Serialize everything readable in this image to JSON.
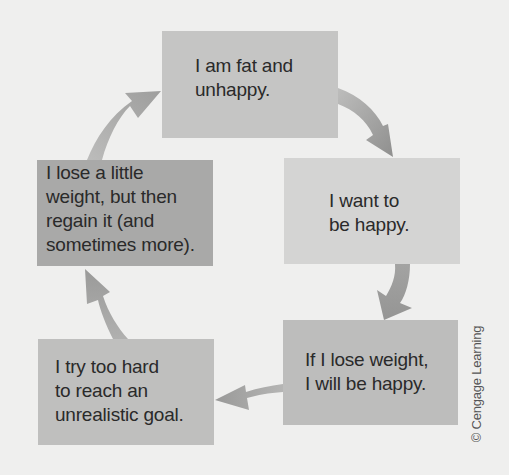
{
  "diagram": {
    "type": "cycle",
    "nodes": [
      {
        "id": "top",
        "text": "I am fat and\nunhappy.",
        "color": "#c5c5c4"
      },
      {
        "id": "right",
        "text": "I want to\nbe happy.",
        "color": "#d4d4d3"
      },
      {
        "id": "bottomright",
        "text": "If I lose weight,\nI will be happy.",
        "color": "#bdbdbc"
      },
      {
        "id": "bottomleft",
        "text": "I try too hard\nto reach an\nunrealistic goal.",
        "color": "#bfbfbe"
      },
      {
        "id": "left",
        "text": "I lose a little\nweight, but then\nregain it (and\nsometimes more).",
        "color": "#a9a9a8"
      }
    ],
    "edges": [
      {
        "from": "top",
        "to": "right"
      },
      {
        "from": "right",
        "to": "bottomright"
      },
      {
        "from": "bottomright",
        "to": "bottomleft"
      },
      {
        "from": "bottomleft",
        "to": "left"
      },
      {
        "from": "left",
        "to": "top"
      }
    ],
    "arrow_color": "#a0a09f",
    "background": "#efefee"
  },
  "credit": "© Cengage Learning"
}
